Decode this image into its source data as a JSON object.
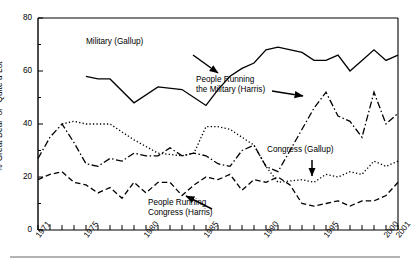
{
  "chart_data": {
    "type": "line",
    "title": "",
    "subtitle": "",
    "xlabel": "",
    "ylabel": "%\"Great Deal\" or \"Quite a Lot\"",
    "xlim": [
      1971,
      2001
    ],
    "ylim": [
      0,
      80
    ],
    "grid": false,
    "legend_position": "inline-annotations",
    "y_ticks": [
      0,
      20,
      40,
      60,
      80
    ],
    "y_tick_labels": [
      "0",
      "20",
      "40",
      "60",
      "80"
    ],
    "y_minor_ticks": [
      10,
      30,
      50,
      70
    ],
    "x_ticks": [
      1971,
      1972,
      1973,
      1974,
      1975,
      1976,
      1977,
      1978,
      1979,
      1980,
      1981,
      1982,
      1983,
      1984,
      1985,
      1986,
      1987,
      1988,
      1989,
      1990,
      1991,
      1992,
      1993,
      1994,
      1995,
      1996,
      1997,
      1998,
      1999,
      2000,
      2001
    ],
    "x_tick_labels": [
      "1971",
      "1975",
      "1980",
      "1985",
      "1990",
      "1995",
      "2000",
      "2001"
    ],
    "x_labeled_ticks": [
      1971,
      1975,
      1980,
      1985,
      1990,
      1995,
      2000,
      2001
    ],
    "series": [
      {
        "name": "Military (Gallup)",
        "style": "solid",
        "x": [
          1975,
          1976,
          1977,
          1979,
          1981,
          1983,
          1984,
          1985,
          1986,
          1987,
          1988,
          1989,
          1990,
          1991,
          1993,
          1994,
          1995,
          1996,
          1997,
          1998,
          1999,
          2000,
          2001
        ],
        "values": [
          58,
          57,
          57,
          48,
          54,
          53,
          50,
          47,
          53,
          58,
          61,
          63,
          68,
          69,
          67,
          64,
          64,
          66,
          60,
          64,
          68,
          64,
          66
        ]
      },
      {
        "name": "People Running the Military (Harris)",
        "style": "dashdot",
        "x": [
          1971,
          1972,
          1973,
          1974,
          1975,
          1976,
          1977,
          1978,
          1979,
          1980,
          1981,
          1982,
          1983,
          1984,
          1985,
          1986,
          1987,
          1988,
          1989,
          1990,
          1991,
          1992,
          1993,
          1994,
          1995,
          1996,
          1997,
          1998,
          1999,
          2000,
          2001
        ],
        "values": [
          27,
          35,
          40,
          33,
          25,
          24,
          27,
          26,
          29,
          28,
          28,
          31,
          28,
          29,
          28,
          25,
          24,
          30,
          32,
          24,
          22,
          30,
          38,
          46,
          52,
          43,
          41,
          35,
          52,
          40,
          44
        ]
      },
      {
        "name": "Congress (Gallup)",
        "style": "dotted",
        "x": [
          1973,
          1974,
          1975,
          1976,
          1977,
          1979,
          1981,
          1983,
          1984,
          1985,
          1986,
          1987,
          1988,
          1989,
          1990,
          1991,
          1993,
          1994,
          1995,
          1996,
          1997,
          1998,
          1999,
          2000,
          2001
        ],
        "values": [
          40,
          41,
          40,
          40,
          40,
          34,
          29,
          28,
          29,
          39,
          39,
          38,
          35,
          32,
          24,
          18,
          19,
          18,
          21,
          20,
          22,
          21,
          26,
          24,
          26
        ]
      },
      {
        "name": "People Running Congress (Harris)",
        "style": "dashed",
        "x": [
          1971,
          1972,
          1973,
          1974,
          1975,
          1976,
          1977,
          1978,
          1979,
          1980,
          1981,
          1982,
          1983,
          1984,
          1985,
          1986,
          1987,
          1988,
          1989,
          1990,
          1991,
          1992,
          1993,
          1994,
          1995,
          1996,
          1997,
          1998,
          1999,
          2000,
          2001
        ],
        "values": [
          19,
          21,
          22,
          18,
          17,
          14,
          16,
          12,
          18,
          14,
          18,
          18,
          13,
          17,
          20,
          19,
          21,
          15,
          19,
          18,
          20,
          17,
          10,
          9,
          10,
          11,
          9,
          11,
          11,
          13,
          18
        ]
      }
    ],
    "annotations": [
      {
        "name": "military-gallup",
        "text": "Military (Gallup)",
        "x_px": 86,
        "y_px": 42,
        "arrow": {
          "x1": 193,
          "y1": 55,
          "x2": 218,
          "y2": 73
        }
      },
      {
        "name": "people-running-military-harris",
        "line1": "People Running",
        "line2": "the Military (Harris)",
        "x_px": 196,
        "y_px": 80,
        "arrow": {
          "x1": 272,
          "y1": 91,
          "x2": 303,
          "y2": 96
        }
      },
      {
        "name": "congress-gallup",
        "text": "Congress (Gallup)",
        "x_px": 267,
        "y_px": 150,
        "arrow": {
          "x1": 312,
          "y1": 160,
          "x2": 312,
          "y2": 176
        }
      },
      {
        "name": "people-running-congress-harris",
        "line1": "People Running",
        "line2": "Congress (Harris)",
        "x_px": 148,
        "y_px": 203,
        "arrow": {
          "x1": 212,
          "y1": 209,
          "x2": 186,
          "y2": 196
        }
      }
    ]
  }
}
